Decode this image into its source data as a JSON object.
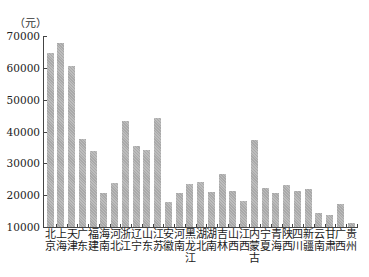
{
  "chart_data": {
    "type": "bar",
    "title": "",
    "unit_label": "（元）",
    "xlabel": "",
    "ylabel": "元",
    "ylim": [
      10000,
      70000
    ],
    "yticks": [
      70000,
      60000,
      50000,
      40000,
      30000,
      20000,
      10000
    ],
    "grid": false,
    "legend": null,
    "bar_color": "#b3b3b3",
    "categories": [
      "北京",
      "上海",
      "天津",
      "广东",
      "福建",
      "海南",
      "河北",
      "浙江",
      "辽宁",
      "山东",
      "江苏",
      "安徽",
      "河南",
      "黑龙江",
      "湖北",
      "湖南",
      "吉林",
      "山西",
      "江西",
      "内蒙古",
      "宁夏",
      "青海",
      "陕西",
      "四川",
      "新疆",
      "云南",
      "甘肃",
      "广西",
      "贵州"
    ],
    "values": [
      64700,
      67800,
      60700,
      37800,
      34000,
      20700,
      23700,
      43200,
      35500,
      34200,
      44300,
      17900,
      20700,
      23500,
      24000,
      21000,
      26500,
      21300,
      18200,
      37300,
      22200,
      20700,
      23100,
      21300,
      22000,
      14400,
      13800,
      17200,
      11300
    ]
  },
  "axis": {
    "unit": "（元）",
    "ticks": [
      "70000",
      "60000",
      "50000",
      "40000",
      "30000",
      "20000",
      "10000"
    ]
  }
}
